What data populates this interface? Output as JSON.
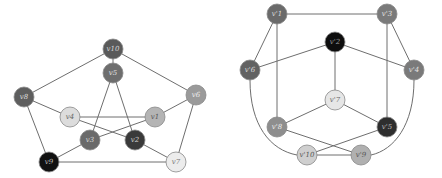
{
  "graphs": [
    {
      "id": "left",
      "node_radius": 10,
      "nodes": [
        {
          "id": "v10",
          "label": "v10",
          "x": 113,
          "y": 49,
          "fill": "#5a5a5a",
          "text": "#d8d8d8"
        },
        {
          "id": "v5",
          "label": "v5",
          "x": 113,
          "y": 73,
          "fill": "#6e6e6e",
          "text": "#e0e0e0"
        },
        {
          "id": "v8",
          "label": "v8",
          "x": 24,
          "y": 97,
          "fill": "#5e5e5e",
          "text": "#dcdcdc"
        },
        {
          "id": "v6",
          "label": "v6",
          "x": 196,
          "y": 95,
          "fill": "#9a9a9a",
          "text": "#eeeeee"
        },
        {
          "id": "v4",
          "label": "v4",
          "x": 70,
          "y": 117,
          "fill": "#dcdcdc",
          "text": "#666666"
        },
        {
          "id": "v1",
          "label": "v1",
          "x": 155,
          "y": 117,
          "fill": "#b4b4b4",
          "text": "#555555"
        },
        {
          "id": "v3",
          "label": "v3",
          "x": 90,
          "y": 140,
          "fill": "#6a6a6a",
          "text": "#d8d8d8"
        },
        {
          "id": "v2",
          "label": "v2",
          "x": 135,
          "y": 140,
          "fill": "#3a3a3a",
          "text": "#cfcfcf"
        },
        {
          "id": "v9",
          "label": "v9",
          "x": 49,
          "y": 162,
          "fill": "#111111",
          "text": "#bbbbbb"
        },
        {
          "id": "v7",
          "label": "v7",
          "x": 176,
          "y": 162,
          "fill": "#ececec",
          "text": "#777777"
        }
      ],
      "edges": [
        [
          "v10",
          "v5"
        ],
        [
          "v10",
          "v8"
        ],
        [
          "v10",
          "v6"
        ],
        [
          "v8",
          "v4"
        ],
        [
          "v8",
          "v9"
        ],
        [
          "v6",
          "v1"
        ],
        [
          "v6",
          "v7"
        ],
        [
          "v9",
          "v7"
        ],
        [
          "v9",
          "v3"
        ],
        [
          "v5",
          "v3"
        ],
        [
          "v5",
          "v2"
        ],
        [
          "v4",
          "v1"
        ],
        [
          "v4",
          "v2"
        ],
        [
          "v1",
          "v3"
        ],
        [
          "v2",
          "v7"
        ]
      ]
    },
    {
      "id": "right",
      "node_radius": 10,
      "nodes": [
        {
          "id": "v1p",
          "label": "v'1",
          "x": 277,
          "y": 14,
          "fill": "#6a6a6a",
          "text": "#dddddd"
        },
        {
          "id": "v3p",
          "label": "v'3",
          "x": 387,
          "y": 14,
          "fill": "#7a7a7a",
          "text": "#e2e2e2"
        },
        {
          "id": "v2p",
          "label": "v'2",
          "x": 335,
          "y": 42,
          "fill": "#0e0e0e",
          "text": "#9a9a9a"
        },
        {
          "id": "v6p",
          "label": "v'6",
          "x": 250,
          "y": 70,
          "fill": "#626262",
          "text": "#dcdcdc"
        },
        {
          "id": "v4p",
          "label": "v'4",
          "x": 414,
          "y": 70,
          "fill": "#7a7a7a",
          "text": "#e2e2e2"
        },
        {
          "id": "v7p",
          "label": "v'7",
          "x": 335,
          "y": 100,
          "fill": "#e6e6e6",
          "text": "#666666"
        },
        {
          "id": "v8p",
          "label": "v'8",
          "x": 277,
          "y": 127,
          "fill": "#8e8e8e",
          "text": "#ececec"
        },
        {
          "id": "v5p",
          "label": "v'5",
          "x": 387,
          "y": 127,
          "fill": "#2e2e2e",
          "text": "#bbbbbb"
        },
        {
          "id": "v10p",
          "label": "v'10",
          "x": 307,
          "y": 155,
          "fill": "#cfcfcf",
          "text": "#555555"
        },
        {
          "id": "v9p",
          "label": "v'9",
          "x": 361,
          "y": 155,
          "fill": "#b0b0b0",
          "text": "#555555"
        }
      ],
      "edges": [
        [
          "v1p",
          "v3p"
        ],
        [
          "v1p",
          "v6p"
        ],
        [
          "v1p",
          "v8p"
        ],
        [
          "v3p",
          "v4p"
        ],
        [
          "v3p",
          "v5p"
        ],
        [
          "v2p",
          "v6p"
        ],
        [
          "v2p",
          "v4p"
        ],
        [
          "v2p",
          "v7p"
        ],
        [
          "v7p",
          "v8p"
        ],
        [
          "v7p",
          "v5p"
        ],
        [
          "v8p",
          "v9p"
        ],
        [
          "v5p",
          "v10p"
        ],
        [
          "v10p",
          "v9p"
        ]
      ],
      "curved_edges": [
        {
          "from": "v6p",
          "to": "v10p",
          "path": "M250,80 C250,125 270,150 297,155"
        },
        {
          "from": "v4p",
          "to": "v9p",
          "path": "M414,80 C414,125 394,150 371,155"
        }
      ]
    }
  ]
}
